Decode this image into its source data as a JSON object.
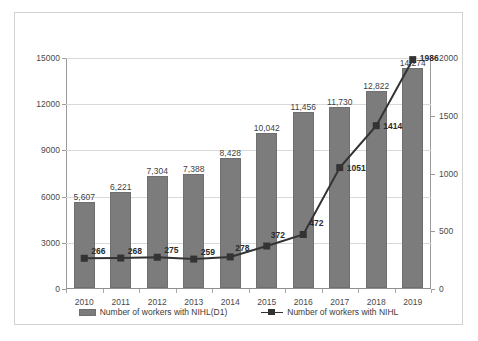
{
  "chart_data": {
    "type": "bar",
    "title": "",
    "subtitle": "",
    "xlabel": "",
    "ylabel": "",
    "categories": [
      "2010",
      "2011",
      "2012",
      "2013",
      "2014",
      "2015",
      "2016",
      "2017",
      "2018",
      "2019"
    ],
    "series": [
      {
        "name": "Number of workers with NIHL(D1)",
        "type": "bar",
        "axis": "left",
        "color": "#7c7c7c",
        "values": [
          5607,
          6221,
          7304,
          7388,
          8428,
          10042,
          11456,
          11730,
          12822,
          14274
        ],
        "labels": [
          "5,607",
          "6,221",
          "7,304",
          "7,388",
          "8,428",
          "10,042",
          "11,456",
          "11,730",
          "12,822",
          "14,274"
        ]
      },
      {
        "name": "Number of workers with NIHL",
        "type": "line",
        "axis": "right",
        "color": "#333333",
        "values": [
          266,
          268,
          275,
          259,
          278,
          372,
          472,
          1051,
          1414,
          1986
        ],
        "labels": [
          "266",
          "268",
          "275",
          "259",
          "278",
          "372",
          "472",
          "1051",
          "1414",
          "1986"
        ]
      }
    ],
    "y_left": {
      "ticks": [
        0,
        3000,
        6000,
        9000,
        12000,
        15000
      ],
      "tick_labels": [
        "0",
        "3000",
        "6000",
        "9000",
        "12000",
        "15000"
      ],
      "min": 0,
      "max": 15000
    },
    "y_right": {
      "ticks": [
        0,
        500,
        1000,
        1500,
        2000
      ],
      "tick_labels": [
        "0",
        "500",
        "1000",
        "1500",
        "2000"
      ],
      "min": 0,
      "max": 2000
    },
    "grid": true,
    "legend_position": "bottom"
  },
  "legend": {
    "bar_label": "Number of workers with NIHL(D1)",
    "line_label": "Number of workers with NIHL"
  }
}
